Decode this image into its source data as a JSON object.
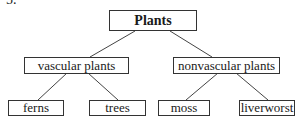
{
  "question_number": "5.",
  "tree": {
    "root": "Plants",
    "level1": [
      "vascular plants",
      "nonvascular plants"
    ],
    "level2": [
      "ferns",
      "trees",
      "moss",
      "liverworst"
    ]
  },
  "edges": [
    [
      "Plants",
      "vascular plants"
    ],
    [
      "Plants",
      "nonvascular plants"
    ],
    [
      "vascular plants",
      "ferns"
    ],
    [
      "vascular plants",
      "trees"
    ],
    [
      "nonvascular plants",
      "moss"
    ],
    [
      "nonvascular plants",
      "liverworst"
    ]
  ]
}
